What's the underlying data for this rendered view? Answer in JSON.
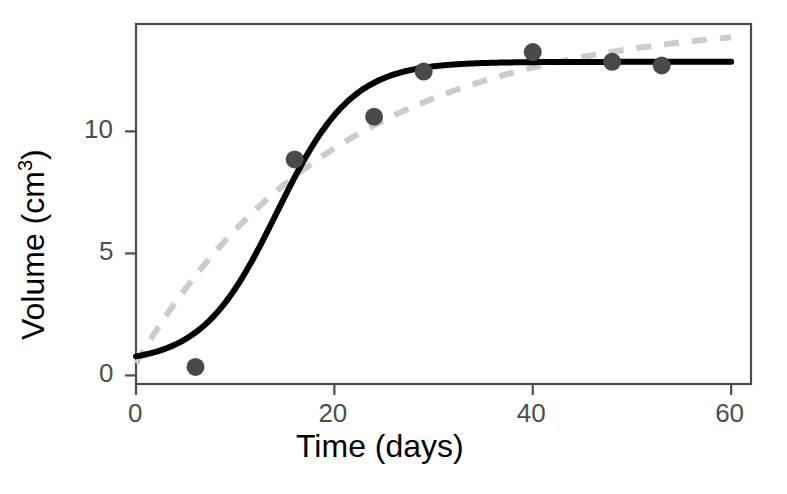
{
  "chart_data": {
    "type": "scatter",
    "title": "",
    "xlabel": "Time (days)",
    "ylabel_parts": {
      "base": "Volume (cm",
      "sup": "3",
      "close": ")"
    },
    "ylabel": "Volume (cm3)",
    "xlim": [
      0,
      62
    ],
    "ylim": [
      -0.35,
      14.4
    ],
    "xticks": [
      0,
      20,
      40,
      60
    ],
    "xtick_labels": [
      "0",
      "20",
      "40",
      "60"
    ],
    "yticks": [
      0,
      5,
      10
    ],
    "ytick_labels": [
      "0",
      "5",
      "10"
    ],
    "grid": false,
    "legend": "none",
    "points": {
      "name": "Observed volume",
      "marker": "filled-circle",
      "color": "#4a4a4a",
      "x": [
        6,
        16,
        24,
        29,
        40,
        48,
        53
      ],
      "y": [
        0.35,
        8.85,
        10.6,
        12.45,
        13.25,
        12.85,
        12.7
      ]
    },
    "series": [
      {
        "name": "Logistic fit",
        "style": "solid",
        "color": "#000000",
        "width": 5,
        "model": "logistic",
        "params": {
          "asymptote": 12.85,
          "inflection_day": 14.2,
          "rate": 0.265,
          "y0": 0.5
        }
      },
      {
        "name": "Monomolecular fit",
        "style": "dashed",
        "color": "#cccccc",
        "width": 5,
        "model": "monomolecular",
        "params": {
          "asymptote": 14.6,
          "rate": 0.049,
          "y0": 0.5
        }
      }
    ],
    "panel": {
      "left": 136,
      "right": 751,
      "top": 24,
      "bottom": 384,
      "border_color": "#4d4d4d"
    }
  }
}
